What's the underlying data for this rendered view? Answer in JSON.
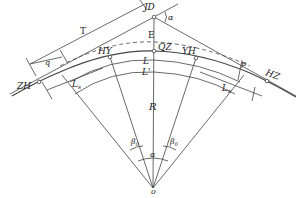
{
  "diagram": {
    "points": {
      "ZH": "ZH",
      "HY": "HY",
      "QZ": "QZ",
      "YH": "YH",
      "HZ": "HZ",
      "JD": "JD",
      "O": "o"
    },
    "labels": {
      "T": "T",
      "q": "q",
      "E": "E",
      "L": "L",
      "L_prime": "L'",
      "L1_left": "L",
      "L1_left_sub": "s",
      "L1_right": "L",
      "L1_right_sub": "s",
      "R": "R",
      "p": "p",
      "alpha_top": "α",
      "alpha_bottom": "α",
      "beta_left": "β",
      "beta_left_sub": "0",
      "beta_right": "β",
      "beta_right_sub": "0"
    },
    "colors": {
      "line": "#444444",
      "text": "#222222",
      "background": "#ffffff"
    }
  }
}
